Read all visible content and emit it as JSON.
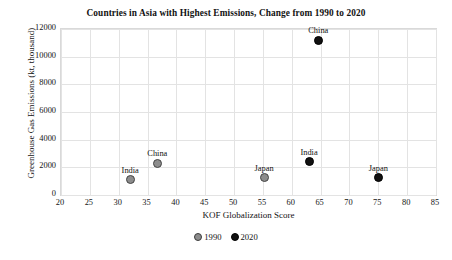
{
  "chart_data": {
    "type": "scatter",
    "title": "Countries in Asia with Highest Emissions, Change from 1990 to 2020",
    "xlabel": "KOF Globalization Score",
    "ylabel": "Greenhouse Gas  Emissions (kt, thousand)",
    "xlim": [
      20,
      85
    ],
    "ylim": [
      0,
      12000
    ],
    "xticks": [
      20,
      25,
      30,
      35,
      40,
      45,
      50,
      55,
      60,
      65,
      70,
      75,
      80,
      85
    ],
    "yticks": [
      0,
      2000,
      4000,
      6000,
      8000,
      10000,
      12000
    ],
    "grid": true,
    "legend_position": "bottom",
    "series": [
      {
        "name": "1990",
        "color": "#8c8c8c",
        "points": [
          {
            "label": "India",
            "x": 32.0,
            "y": 1100
          },
          {
            "label": "China",
            "x": 36.7,
            "y": 2300
          },
          {
            "label": "Japan",
            "x": 55.2,
            "y": 1250
          }
        ]
      },
      {
        "name": "2020",
        "color": "#111111",
        "points": [
          {
            "label": "India",
            "x": 63.0,
            "y": 2400
          },
          {
            "label": "China",
            "x": 64.6,
            "y": 11200
          },
          {
            "label": "Japan",
            "x": 75.0,
            "y": 1250
          }
        ]
      }
    ],
    "legend": [
      {
        "label": "1990",
        "color": "#8c8c8c"
      },
      {
        "label": "2020",
        "color": "#111111"
      }
    ]
  }
}
